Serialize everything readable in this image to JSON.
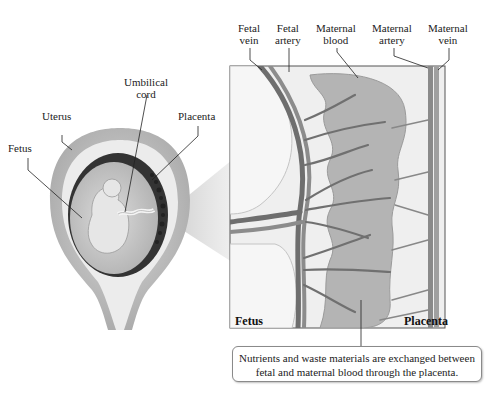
{
  "labels": {
    "fetus": "Fetus",
    "uterus": "Uterus",
    "umbilical_cord": [
      "Umbilical",
      "cord"
    ],
    "placenta": "Placenta",
    "fetal_vein": [
      "Fetal",
      "vein"
    ],
    "fetal_artery": [
      "Fetal",
      "artery"
    ],
    "maternal_blood": [
      "Maternal",
      "blood"
    ],
    "maternal_artery": [
      "Maternal",
      "artery"
    ],
    "maternal_vein": [
      "Maternal",
      "vein"
    ]
  },
  "panel": {
    "left_label": "Fetus",
    "right_label": "Placenta"
  },
  "caption": {
    "line1": "Nutrients and waste materials are exchanged between",
    "line2": "fetal and maternal blood through the placenta."
  },
  "colors": {
    "uterus_wall": "#b8b8b8",
    "uterus_inner": "#e8e8e8",
    "amniotic": "#d0d0d0",
    "dark_lining": "#3a3a3a",
    "vessel": "#7a7a7a",
    "maternal_blood": "#a8a8a8",
    "panel_bg": "#ececec"
  }
}
